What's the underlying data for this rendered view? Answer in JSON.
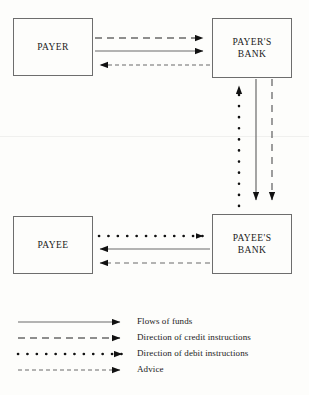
{
  "diagram": {
    "type": "flow-diagram",
    "nodes": [
      {
        "id": "payer",
        "label": "PAYER"
      },
      {
        "id": "payers_bank",
        "label": "PAYER'S\nBANK"
      },
      {
        "id": "payee",
        "label": "PAYEE"
      },
      {
        "id": "payees_bank",
        "label": "PAYEE'S\nBANK"
      }
    ],
    "edges": [
      {
        "from": "payer",
        "to": "payers_bank",
        "style": "dashed",
        "meaning": "Direction of credit instructions"
      },
      {
        "from": "payer",
        "to": "payers_bank",
        "style": "solid",
        "meaning": "Flows of funds"
      },
      {
        "from": "payers_bank",
        "to": "payer",
        "style": "fine-dashed",
        "meaning": "Advice"
      },
      {
        "from": "payees_bank",
        "to": "payers_bank",
        "style": "dotted",
        "meaning": "Direction of debit instructions"
      },
      {
        "from": "payers_bank",
        "to": "payees_bank",
        "style": "solid",
        "meaning": "Flows of funds"
      },
      {
        "from": "payers_bank",
        "to": "payees_bank",
        "style": "fine-dashed",
        "meaning": "Advice"
      },
      {
        "from": "payee",
        "to": "payees_bank",
        "style": "dotted",
        "meaning": "Direction of debit instructions"
      },
      {
        "from": "payees_bank",
        "to": "payee",
        "style": "solid",
        "meaning": "Flows of funds"
      },
      {
        "from": "payees_bank",
        "to": "payee",
        "style": "fine-dashed",
        "meaning": "Advice"
      }
    ]
  },
  "nodes": {
    "payer": "PAYER",
    "payers_bank_line1": "PAYER'S",
    "payers_bank_line2": "BANK",
    "payee": "PAYEE",
    "payees_bank_line1": "PAYEE'S",
    "payees_bank_line2": "BANK"
  },
  "legend": {
    "items": [
      {
        "style": "solid",
        "label": "Flows of funds"
      },
      {
        "style": "dashed",
        "label": "Direction of credit instructions"
      },
      {
        "style": "dotted",
        "label": "Direction of debit instructions"
      },
      {
        "style": "fine-dashed",
        "label": "Advice"
      }
    ]
  },
  "colors": {
    "background": "#fdfdfb",
    "box_border": "#6d6d6d",
    "line": "#5a5a5a",
    "dotted_line": "#111111",
    "text": "#1a1a1a"
  }
}
